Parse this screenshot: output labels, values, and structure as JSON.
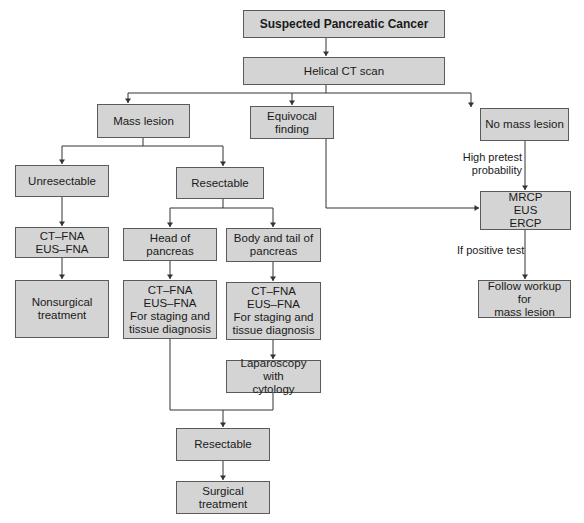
{
  "diagram": {
    "type": "flowchart",
    "colors": {
      "box_fill": "#d4d4d4",
      "box_border": "#5a5a5a",
      "line": "#333333",
      "background": "#ffffff"
    },
    "nodes": {
      "start": "Suspected Pancreatic Cancer",
      "helical_ct": "Helical CT scan",
      "mass_lesion": "Mass lesion",
      "equivocal": "Equivocal finding",
      "no_mass": "No mass lesion",
      "unresectable": "Unresectable",
      "resectable": "Resectable",
      "ct_fna_left": "CT–FNA\nEUS–FNA",
      "nonsurgical": "Nonsurgical\ntreatment",
      "head_pancreas": "Head of pancreas",
      "body_tail": "Body and tail of\npancreas",
      "ct_fna_head": "CT–FNA\nEUS–FNA\nFor staging and\ntissue diagnosis",
      "ct_fna_body": "CT–FNA\nEUS–FNA\nFor staging and\ntissue diagnosis",
      "laparoscopy": "Laparoscopy with\ncytology",
      "resectable_final": "Resectable",
      "surgical": "Surgical treatment",
      "mrcp_group": "MRCP\nEUS\nERCP",
      "follow_workup": "Follow workup for\nmass lesion"
    },
    "edge_labels": {
      "high_pretest": "High pretest\nprobability",
      "if_positive": "If positive test"
    },
    "edges": [
      [
        "start",
        "helical_ct"
      ],
      [
        "helical_ct",
        "mass_lesion"
      ],
      [
        "helical_ct",
        "equivocal"
      ],
      [
        "helical_ct",
        "no_mass"
      ],
      [
        "mass_lesion",
        "unresectable"
      ],
      [
        "mass_lesion",
        "resectable"
      ],
      [
        "unresectable",
        "ct_fna_left"
      ],
      [
        "ct_fna_left",
        "nonsurgical"
      ],
      [
        "resectable",
        "head_pancreas"
      ],
      [
        "resectable",
        "body_tail"
      ],
      [
        "head_pancreas",
        "ct_fna_head"
      ],
      [
        "body_tail",
        "ct_fna_body"
      ],
      [
        "ct_fna_body",
        "laparoscopy"
      ],
      [
        "ct_fna_head",
        "resectable_final"
      ],
      [
        "laparoscopy",
        "resectable_final"
      ],
      [
        "resectable_final",
        "surgical"
      ],
      [
        "equivocal",
        "mrcp_group"
      ],
      [
        "no_mass",
        "mrcp_group",
        "High pretest probability"
      ],
      [
        "mrcp_group",
        "follow_workup",
        "If positive test"
      ]
    ]
  }
}
